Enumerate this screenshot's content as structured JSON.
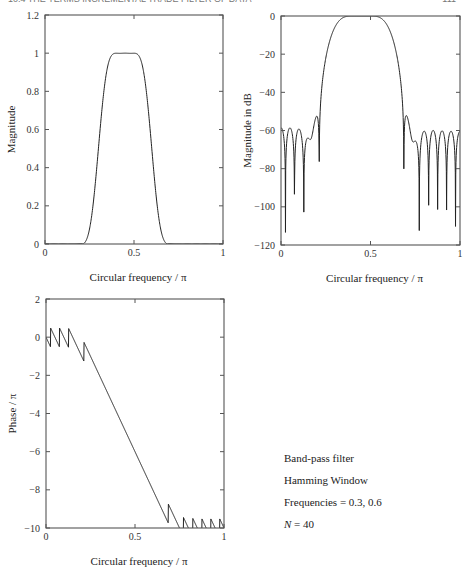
{
  "header": {
    "left_text": "10.4  THE TERMS INCREMENTAL TRADE FILTER OF DATA",
    "right_text": "111"
  },
  "annotation": {
    "lines": [
      "Band-pass filter",
      "Hamming Window",
      "Frequencies  = 0.3, 0.6"
    ],
    "n_label": "N",
    "n_value": " = 40"
  },
  "filter": {
    "type": "bandpass",
    "window": "hamming",
    "f_low": 0.3,
    "f_high": 0.6,
    "N": 40
  },
  "chart_data": [
    {
      "id": "magnitude",
      "type": "line",
      "title": "",
      "xlabel": "Circular frequency /  π",
      "ylabel": "Magnitude",
      "xlim": [
        0,
        1
      ],
      "ylim": [
        0,
        1.2
      ],
      "xticks": [
        0,
        0.5,
        1
      ],
      "xtick_labels": [
        "0",
        "0.5",
        "1"
      ],
      "yticks": [
        0,
        0.2,
        0.4,
        0.6,
        0.8,
        1,
        1.2
      ],
      "ytick_labels": [
        "0",
        "0.2",
        "0.4",
        "0.6",
        "0.8",
        "1",
        "1.2"
      ],
      "grid": false,
      "box": {
        "x0": 45,
        "y0": 15,
        "x1": 223,
        "y1": 244
      },
      "series": [
        {
          "name": "|H(f)|",
          "x": [
            0,
            0.2,
            0.25,
            0.3,
            0.35,
            0.4,
            0.45,
            0.5,
            0.55,
            0.6,
            0.65,
            0.7,
            1.0
          ],
          "values": [
            0,
            0,
            0.1,
            0.5,
            0.9,
            1.0,
            1.0,
            1.0,
            0.9,
            0.5,
            0.1,
            0,
            0
          ]
        }
      ]
    },
    {
      "id": "magnitude_db",
      "type": "line",
      "title": "",
      "xlabel": "Circular frequency /  π",
      "ylabel": "Magnitude in dB",
      "xlim": [
        0,
        1
      ],
      "ylim": [
        -120,
        0
      ],
      "xticks": [
        0,
        0.5,
        1
      ],
      "xtick_labels": [
        "0",
        "0.5",
        "1"
      ],
      "yticks": [
        0,
        -20,
        -40,
        -60,
        -80,
        -100,
        -120
      ],
      "ytick_labels": [
        "0",
        "−20",
        "−40",
        "−60",
        "−80",
        "−100",
        "−120"
      ],
      "grid": false,
      "box": {
        "x0": 281,
        "y0": 16,
        "x1": 460,
        "y1": 245
      },
      "series": [
        {
          "name": "20log10|H(f)|",
          "description": "passband 0 dB near 0.35–0.55; stopband sidelobes ≈ −50 to −90 dB; nulls to ≈ −105 dB"
        }
      ]
    },
    {
      "id": "phase",
      "type": "line",
      "title": "",
      "xlabel": "Circular frequency /  π",
      "ylabel": "Phase / π",
      "xlim": [
        0,
        1
      ],
      "ylim": [
        -10,
        2
      ],
      "xticks": [
        0,
        0.5,
        1
      ],
      "xtick_labels": [
        "0",
        "0.5",
        "1"
      ],
      "yticks": [
        2,
        0,
        -2,
        -4,
        -6,
        -8,
        -10
      ],
      "ytick_labels": [
        "2",
        "0",
        "−2",
        "−4",
        "−6",
        "−8",
        "−10"
      ],
      "grid": false,
      "box": {
        "x0": 46,
        "y0": 299,
        "x1": 224,
        "y1": 528
      },
      "series": [
        {
          "name": "phase/π",
          "description": "linear phase slope ≈ −19.5 in passband (0.2→0.68: −0.5 → −9.4) with sawtooth jumps of +1 in stopbands"
        }
      ]
    }
  ]
}
